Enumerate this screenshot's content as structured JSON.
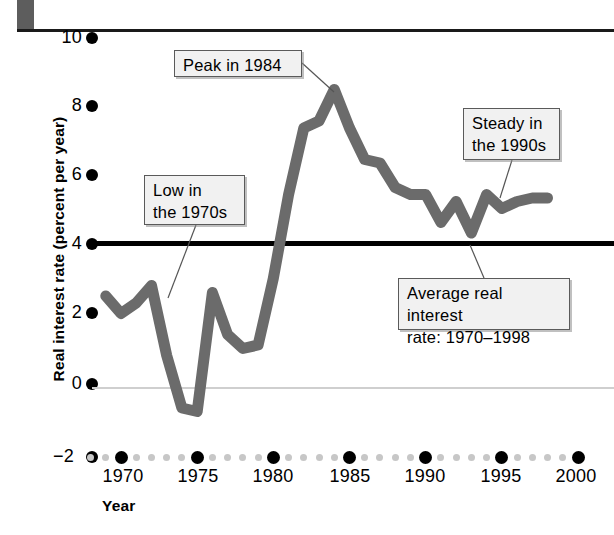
{
  "chart_data": {
    "type": "line",
    "title": "",
    "xlabel": "Year",
    "ylabel": "Real interest rate (percent per year)",
    "xlim": [
      1968,
      2000
    ],
    "ylim": [
      -2,
      10
    ],
    "xticks": [
      1970,
      1975,
      1980,
      1985,
      1990,
      1995,
      2000
    ],
    "xtick_labels": [
      "1970",
      "1975",
      "1980",
      "1985",
      "1990",
      "1995",
      "2000"
    ],
    "yticks": [
      -2,
      0,
      2,
      4,
      6,
      8,
      10
    ],
    "ytick_labels": [
      "−2",
      "0",
      "2",
      "4",
      "6",
      "8",
      "10"
    ],
    "grid": false,
    "legend": "none",
    "series": [
      {
        "name": "Real interest rate",
        "color": "#6b6b6b",
        "x": [
          1969,
          1970,
          1971,
          1972,
          1973,
          1974,
          1975,
          1976,
          1977,
          1978,
          1979,
          1980,
          1981,
          1982,
          1983,
          1984,
          1985,
          1986,
          1987,
          1988,
          1989,
          1990,
          1991,
          1992,
          1993,
          1994,
          1995,
          1996,
          1997,
          1998
        ],
        "y": [
          2.5,
          2.0,
          2.3,
          2.8,
          0.8,
          -0.7,
          -0.8,
          2.6,
          1.4,
          1.0,
          1.1,
          3.0,
          5.4,
          7.3,
          7.5,
          8.4,
          7.3,
          6.4,
          6.3,
          5.6,
          5.4,
          5.4,
          4.6,
          5.2,
          4.3,
          5.4,
          5.0,
          5.2,
          5.3,
          5.3
        ]
      }
    ],
    "reference_lines": [
      {
        "name": "average-real-interest-rate",
        "value": 4.0,
        "color": "#000000",
        "style": "solid-thick"
      },
      {
        "name": "zero-line",
        "value": 0.0,
        "color": "#cfcfcf",
        "style": "solid-thin"
      }
    ],
    "annotations": [
      {
        "id": "peak",
        "text": "Peak in 1984",
        "points_to_year": 1984,
        "points_to_value": 8.4
      },
      {
        "id": "low",
        "text": "Low in\nthe 1970s",
        "points_to_year": 1972,
        "points_to_value": 2.4
      },
      {
        "id": "steady",
        "text": "Steady in\nthe 1990s",
        "points_to_year": 1995,
        "points_to_value": 5.0
      },
      {
        "id": "avg",
        "text": "Average real interest\nrate: 1970–1998",
        "points_to_year": 1992,
        "points_to_value": 4.0
      }
    ]
  },
  "axis": {
    "ylabel": "Real interest rate (percent per year)",
    "xlabel": "Year",
    "ytick_labels": [
      "10",
      "8",
      "6",
      "4",
      "2",
      "0",
      "−2"
    ],
    "xtick_labels": [
      "1970",
      "1975",
      "1980",
      "1985",
      "1990",
      "1995",
      "2000"
    ]
  },
  "callouts": {
    "peak": "Peak in 1984",
    "low": "Low in\nthe 1970s",
    "steady": "Steady in\nthe 1990s",
    "average": "Average real interest\nrate: 1970–1998"
  },
  "colors": {
    "line": "#6b6b6b",
    "average_line": "#000000",
    "zero_line": "#cfcfcf",
    "callout_border": "#5a5a5a",
    "callout_fill": "#f1f1f1",
    "minor_dot": "#c7c7c7",
    "major_dot": "#000000"
  }
}
